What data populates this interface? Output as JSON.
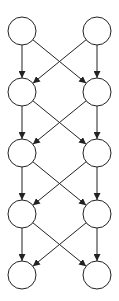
{
  "diagram": {
    "type": "directed-graph",
    "layout": "layered-butterfly",
    "width": 119,
    "height": 301,
    "node_style": {
      "radius": 14,
      "fill": "#ffffff",
      "stroke": "#222222",
      "stroke_width": 1
    },
    "edge_style": {
      "stroke": "#222222",
      "stroke_width": 1,
      "arrowhead": "filled-triangle"
    },
    "columns_x": [
      22,
      97
    ],
    "rows_y": [
      31,
      92,
      153,
      214,
      275
    ],
    "nodes": [
      {
        "id": "L0",
        "label": "",
        "col": 0,
        "row": 0
      },
      {
        "id": "R0",
        "label": "",
        "col": 1,
        "row": 0
      },
      {
        "id": "L1",
        "label": "",
        "col": 0,
        "row": 1
      },
      {
        "id": "R1",
        "label": "",
        "col": 1,
        "row": 1
      },
      {
        "id": "L2",
        "label": "",
        "col": 0,
        "row": 2
      },
      {
        "id": "R2",
        "label": "",
        "col": 1,
        "row": 2
      },
      {
        "id": "L3",
        "label": "",
        "col": 0,
        "row": 3
      },
      {
        "id": "R3",
        "label": "",
        "col": 1,
        "row": 3
      },
      {
        "id": "L4",
        "label": "",
        "col": 0,
        "row": 4
      },
      {
        "id": "R4",
        "label": "",
        "col": 1,
        "row": 4
      }
    ],
    "edges": [
      {
        "from": "L0",
        "to": "L1"
      },
      {
        "from": "L0",
        "to": "R1"
      },
      {
        "from": "R0",
        "to": "L1"
      },
      {
        "from": "R0",
        "to": "R1"
      },
      {
        "from": "L1",
        "to": "L2"
      },
      {
        "from": "L1",
        "to": "R2"
      },
      {
        "from": "R1",
        "to": "L2"
      },
      {
        "from": "R1",
        "to": "R2"
      },
      {
        "from": "L2",
        "to": "L3"
      },
      {
        "from": "L2",
        "to": "R3"
      },
      {
        "from": "R2",
        "to": "L3"
      },
      {
        "from": "R2",
        "to": "R3"
      },
      {
        "from": "L3",
        "to": "L4"
      },
      {
        "from": "L3",
        "to": "R4"
      },
      {
        "from": "R3",
        "to": "L4"
      },
      {
        "from": "R3",
        "to": "R4"
      }
    ]
  }
}
